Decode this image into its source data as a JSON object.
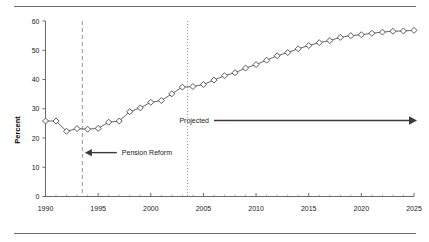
{
  "figure": {
    "top_rule": "horizontal-rule",
    "bottom_rule": "horizontal-rule"
  },
  "chart_data": {
    "type": "line",
    "title": "",
    "subtitle": "",
    "xlabel": "",
    "ylabel": "Percent",
    "xlim": [
      1990,
      2025
    ],
    "ylim": [
      0,
      60
    ],
    "grid": false,
    "legend": "none",
    "marker": "open-diamond",
    "line_color": "#555555",
    "marker_face_color": "#ffffff",
    "marker_edge_color": "#333333",
    "x_ticks": [
      1990,
      1995,
      2000,
      2005,
      2010,
      2015,
      2020,
      2025
    ],
    "x_tick_labels": [
      "1990",
      "1995",
      "2000",
      "2005",
      "2010",
      "2015",
      "2020",
      "2025"
    ],
    "x_minor_ticks": [
      1991,
      1992,
      1993,
      1994,
      1996,
      1997,
      1998,
      1999,
      2001,
      2002,
      2003,
      2004,
      2006,
      2007,
      2008,
      2009,
      2011,
      2012,
      2013,
      2014,
      2016,
      2017,
      2018,
      2019,
      2021,
      2022,
      2023,
      2024
    ],
    "y_ticks": [
      0,
      10,
      20,
      30,
      40,
      50,
      60
    ],
    "y_tick_labels": [
      "0",
      "10",
      "20",
      "30",
      "40",
      "50",
      "60"
    ],
    "x": [
      1990,
      1991,
      1992,
      1993,
      1994,
      1995,
      1996,
      1997,
      1998,
      1999,
      2000,
      2001,
      2002,
      2003,
      2004,
      2005,
      2006,
      2007,
      2008,
      2009,
      2010,
      2011,
      2012,
      2013,
      2014,
      2015,
      2016,
      2017,
      2018,
      2019,
      2020,
      2021,
      2022,
      2023,
      2024,
      2025
    ],
    "values": [
      25.8,
      25.8,
      22.3,
      23.2,
      23.0,
      23.3,
      25.4,
      25.8,
      29.0,
      30.3,
      32.2,
      32.8,
      35.1,
      37.4,
      37.6,
      38.3,
      39.8,
      41.3,
      42.3,
      43.9,
      45.1,
      46.6,
      48.1,
      49.2,
      50.5,
      51.6,
      52.6,
      53.3,
      54.4,
      55.0,
      55.3,
      55.8,
      56.2,
      56.5,
      56.6,
      56.8
    ],
    "annotations": [
      {
        "id": "pension-reform",
        "label": "Pension Reform",
        "arrow": "left",
        "x_target": 1993.5,
        "y": 15
      },
      {
        "id": "projected",
        "label": "Projected",
        "arrow": "right",
        "x_start": 2006,
        "x_end": 2025,
        "y": 26
      }
    ],
    "vlines": [
      {
        "id": "pension-reform-line",
        "x": 1993.5,
        "style": "dashed",
        "color": "#8a8a8a"
      },
      {
        "id": "projection-start-line",
        "x": 2003.5,
        "style": "dotted",
        "color": "#8a8a8a"
      }
    ]
  }
}
